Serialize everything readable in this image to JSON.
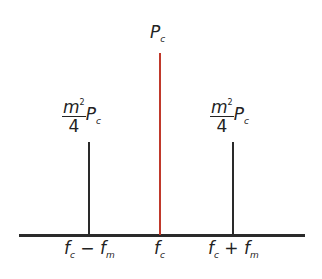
{
  "diagram": {
    "type": "AM spectrum",
    "carrier": {
      "label_main": "P",
      "label_sub": "c",
      "color": "#c0392b"
    },
    "lower_sideband": {
      "num_main": "m",
      "num_sup": "2",
      "den": "4",
      "power_main": "P",
      "power_sub": "c"
    },
    "upper_sideband": {
      "num_main": "m",
      "num_sup": "2",
      "den": "4",
      "power_main": "P",
      "power_sub": "c"
    },
    "axis_labels": {
      "lower": {
        "a": "f",
        "a_sub": "c",
        "op": "−",
        "b": "f",
        "b_sub": "m"
      },
      "center": {
        "a": "f",
        "a_sub": "c"
      },
      "upper": {
        "a": "f",
        "a_sub": "c",
        "op": "+",
        "b": "f",
        "b_sub": "m"
      }
    }
  }
}
